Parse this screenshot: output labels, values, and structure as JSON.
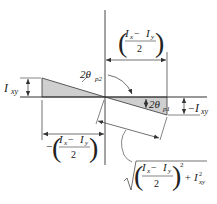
{
  "diagram": {
    "type": "mohr-circle-principal-axes",
    "colors": {
      "line": "#333333",
      "fill": "#cfcfcf",
      "background": "#ffffff"
    },
    "labels": {
      "ixy_left": {
        "main": "I",
        "sub": "xy"
      },
      "neg_ixy_right": {
        "prefix": "−",
        "main": "I",
        "sub": "xy"
      },
      "angle_p2": {
        "main": "2θ",
        "sub": "p2"
      },
      "angle_p1": {
        "main": "2θ",
        "sub": "p1"
      },
      "top_dim": {
        "num_a": "I",
        "sub_a": "x",
        "minus": " − ",
        "num_b": "I",
        "sub_b": "y",
        "den": "2"
      },
      "bottom_dim": {
        "prefix": "−",
        "num_a": "I",
        "sub_a": "x",
        "minus": " − ",
        "num_b": "I",
        "sub_b": "y",
        "den": "2"
      },
      "radius": {
        "num_a": "I",
        "sub_a": "x",
        "minus": " − ",
        "num_b": "I",
        "sub_b": "y",
        "den": "2",
        "exp": "2",
        "plus": "+",
        "term": "I",
        "term_sub": "xy",
        "term_exp": "2"
      }
    }
  }
}
